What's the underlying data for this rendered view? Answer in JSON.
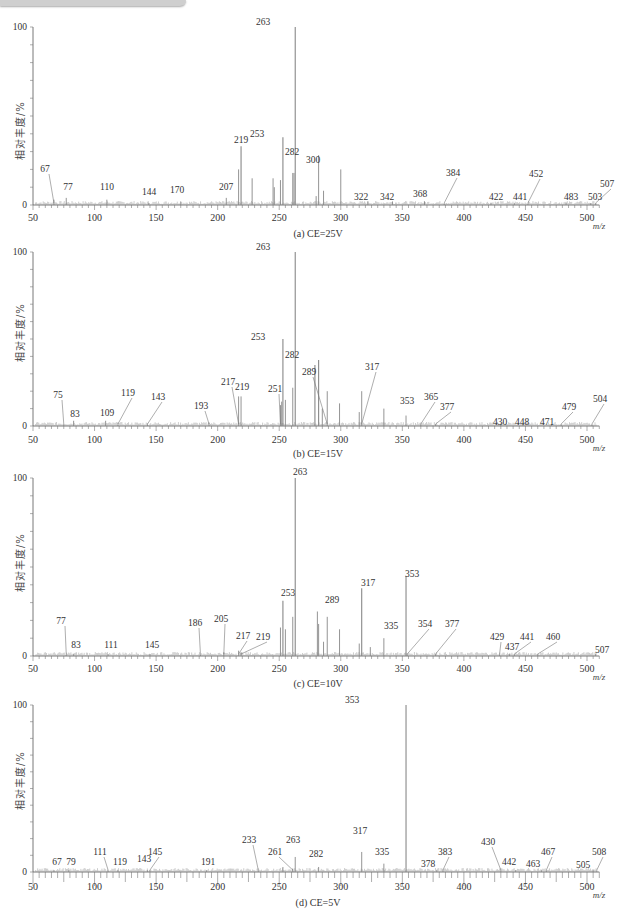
{
  "header": {
    "title_tab": ""
  },
  "chart_data": [
    {
      "type": "bar",
      "panel": "a",
      "title": "(a) CE=25V",
      "xlabel": "m/z",
      "ylabel": "相对丰度/%",
      "xlim": [
        50,
        510
      ],
      "ylim": [
        0,
        100
      ],
      "xticks": [
        50,
        100,
        150,
        200,
        250,
        300,
        350,
        400,
        450,
        500
      ],
      "yticks": [
        0,
        100
      ],
      "peaks": [
        {
          "mz": 67,
          "rel": 3,
          "label": "67"
        },
        {
          "mz": 77,
          "rel": 4,
          "label": "77"
        },
        {
          "mz": 110,
          "rel": 3,
          "label": "110"
        },
        {
          "mz": 144,
          "rel": 1,
          "label": "144"
        },
        {
          "mz": 170,
          "rel": 2,
          "label": "170"
        },
        {
          "mz": 207,
          "rel": 4,
          "label": "207"
        },
        {
          "mz": 217,
          "rel": 20,
          "label": ""
        },
        {
          "mz": 219,
          "rel": 33,
          "label": "219"
        },
        {
          "mz": 228,
          "rel": 15,
          "label": ""
        },
        {
          "mz": 245,
          "rel": 15,
          "label": ""
        },
        {
          "mz": 246,
          "rel": 10,
          "label": ""
        },
        {
          "mz": 251,
          "rel": 14,
          "label": ""
        },
        {
          "mz": 253,
          "rel": 38,
          "label": "253"
        },
        {
          "mz": 261,
          "rel": 18,
          "label": ""
        },
        {
          "mz": 262,
          "rel": 18,
          "label": ""
        },
        {
          "mz": 263,
          "rel": 100,
          "label": "263"
        },
        {
          "mz": 280,
          "rel": 5,
          "label": ""
        },
        {
          "mz": 282,
          "rel": 28,
          "label": "282"
        },
        {
          "mz": 286,
          "rel": 8,
          "label": ""
        },
        {
          "mz": 300,
          "rel": 20,
          "label": "300"
        },
        {
          "mz": 322,
          "rel": 2,
          "label": "322"
        },
        {
          "mz": 342,
          "rel": 2,
          "label": "342"
        },
        {
          "mz": 368,
          "rel": 2,
          "label": "368"
        },
        {
          "mz": 384,
          "rel": 1,
          "label": "384"
        },
        {
          "mz": 422,
          "rel": 1,
          "label": "422"
        },
        {
          "mz": 441,
          "rel": 1,
          "label": "441"
        },
        {
          "mz": 452,
          "rel": 1,
          "label": "452"
        },
        {
          "mz": 483,
          "rel": 1,
          "label": "483"
        },
        {
          "mz": 503,
          "rel": 1,
          "label": "503"
        },
        {
          "mz": 507,
          "rel": 1,
          "label": "507"
        }
      ]
    },
    {
      "type": "bar",
      "panel": "b",
      "title": "(b) CE=15V",
      "xlabel": "m/z",
      "ylabel": "相对丰度/%",
      "xlim": [
        50,
        510
      ],
      "ylim": [
        0,
        100
      ],
      "xticks": [
        50,
        100,
        150,
        200,
        250,
        300,
        350,
        400,
        450,
        500
      ],
      "yticks": [
        0,
        100
      ],
      "peaks": [
        {
          "mz": 75,
          "rel": 1,
          "label": "75"
        },
        {
          "mz": 83,
          "rel": 3,
          "label": "83"
        },
        {
          "mz": 109,
          "rel": 3,
          "label": "109"
        },
        {
          "mz": 119,
          "rel": 2,
          "label": "119"
        },
        {
          "mz": 143,
          "rel": 1,
          "label": "143"
        },
        {
          "mz": 193,
          "rel": 2,
          "label": "193"
        },
        {
          "mz": 217,
          "rel": 17,
          "label": "217"
        },
        {
          "mz": 219,
          "rel": 17,
          "label": "219"
        },
        {
          "mz": 251,
          "rel": 12,
          "label": "251"
        },
        {
          "mz": 252,
          "rel": 14,
          "label": ""
        },
        {
          "mz": 253,
          "rel": 50,
          "label": "253"
        },
        {
          "mz": 255,
          "rel": 15,
          "label": ""
        },
        {
          "mz": 261,
          "rel": 22,
          "label": ""
        },
        {
          "mz": 263,
          "rel": 100,
          "label": "263"
        },
        {
          "mz": 279,
          "rel": 35,
          "label": ""
        },
        {
          "mz": 282,
          "rel": 38,
          "label": "282"
        },
        {
          "mz": 285,
          "rel": 10,
          "label": ""
        },
        {
          "mz": 289,
          "rel": 20,
          "label": "289"
        },
        {
          "mz": 299,
          "rel": 13,
          "label": ""
        },
        {
          "mz": 315,
          "rel": 8,
          "label": ""
        },
        {
          "mz": 317,
          "rel": 20,
          "label": "317"
        },
        {
          "mz": 335,
          "rel": 10,
          "label": ""
        },
        {
          "mz": 353,
          "rel": 6,
          "label": "353"
        },
        {
          "mz": 365,
          "rel": 1,
          "label": "365"
        },
        {
          "mz": 377,
          "rel": 1,
          "label": "377"
        },
        {
          "mz": 430,
          "rel": 1,
          "label": "430"
        },
        {
          "mz": 448,
          "rel": 1,
          "label": "448"
        },
        {
          "mz": 471,
          "rel": 1,
          "label": "471"
        },
        {
          "mz": 479,
          "rel": 1,
          "label": "479"
        },
        {
          "mz": 504,
          "rel": 1,
          "label": "504"
        }
      ]
    },
    {
      "type": "bar",
      "panel": "c",
      "title": "(c) CE=10V",
      "xlabel": "m/z",
      "ylabel": "相对丰度/%",
      "xlim": [
        50,
        510
      ],
      "ylim": [
        0,
        100
      ],
      "xticks": [
        50,
        100,
        150,
        200,
        250,
        300,
        350,
        400,
        450,
        500
      ],
      "yticks": [
        0,
        100
      ],
      "peaks": [
        {
          "mz": 77,
          "rel": 1,
          "label": "77"
        },
        {
          "mz": 83,
          "rel": 1,
          "label": "83"
        },
        {
          "mz": 111,
          "rel": 1,
          "label": "111"
        },
        {
          "mz": 145,
          "rel": 1,
          "label": "145"
        },
        {
          "mz": 186,
          "rel": 1,
          "label": "186"
        },
        {
          "mz": 205,
          "rel": 2,
          "label": "205"
        },
        {
          "mz": 217,
          "rel": 3,
          "label": "217"
        },
        {
          "mz": 219,
          "rel": 2,
          "label": "219"
        },
        {
          "mz": 251,
          "rel": 16,
          "label": ""
        },
        {
          "mz": 253,
          "rel": 31,
          "label": "253"
        },
        {
          "mz": 255,
          "rel": 15,
          "label": ""
        },
        {
          "mz": 261,
          "rel": 22,
          "label": ""
        },
        {
          "mz": 263,
          "rel": 100,
          "label": "263"
        },
        {
          "mz": 281,
          "rel": 25,
          "label": ""
        },
        {
          "mz": 282,
          "rel": 18,
          "label": ""
        },
        {
          "mz": 286,
          "rel": 8,
          "label": ""
        },
        {
          "mz": 289,
          "rel": 22,
          "label": "289"
        },
        {
          "mz": 299,
          "rel": 15,
          "label": ""
        },
        {
          "mz": 315,
          "rel": 7,
          "label": ""
        },
        {
          "mz": 317,
          "rel": 38,
          "label": "317"
        },
        {
          "mz": 324,
          "rel": 5,
          "label": ""
        },
        {
          "mz": 335,
          "rel": 10,
          "label": "335"
        },
        {
          "mz": 353,
          "rel": 45,
          "label": "353"
        },
        {
          "mz": 354,
          "rel": 1,
          "label": "354"
        },
        {
          "mz": 377,
          "rel": 1,
          "label": "377"
        },
        {
          "mz": 429,
          "rel": 1,
          "label": "429"
        },
        {
          "mz": 437,
          "rel": 1,
          "label": "437"
        },
        {
          "mz": 441,
          "rel": 1,
          "label": "441"
        },
        {
          "mz": 460,
          "rel": 1,
          "label": "460"
        },
        {
          "mz": 507,
          "rel": 1,
          "label": "507"
        }
      ]
    },
    {
      "type": "bar",
      "panel": "d",
      "title": "(d) CE=5V",
      "xlabel": "m/z",
      "ylabel": "相对丰度/%",
      "xlim": [
        50,
        510
      ],
      "ylim": [
        0,
        100
      ],
      "xticks": [
        50,
        100,
        150,
        200,
        250,
        300,
        350,
        400,
        450,
        500
      ],
      "yticks": [
        0,
        100
      ],
      "peaks": [
        {
          "mz": 67,
          "rel": 1,
          "label": "67"
        },
        {
          "mz": 79,
          "rel": 1,
          "label": "79"
        },
        {
          "mz": 111,
          "rel": 1,
          "label": "111"
        },
        {
          "mz": 119,
          "rel": 1,
          "label": "119"
        },
        {
          "mz": 143,
          "rel": 1,
          "label": "143"
        },
        {
          "mz": 145,
          "rel": 1,
          "label": "145"
        },
        {
          "mz": 191,
          "rel": 1,
          "label": "191"
        },
        {
          "mz": 233,
          "rel": 1,
          "label": "233"
        },
        {
          "mz": 253,
          "rel": 3,
          "label": ""
        },
        {
          "mz": 261,
          "rel": 2,
          "label": "261"
        },
        {
          "mz": 263,
          "rel": 9,
          "label": "263"
        },
        {
          "mz": 282,
          "rel": 3,
          "label": "282"
        },
        {
          "mz": 317,
          "rel": 12,
          "label": "317"
        },
        {
          "mz": 335,
          "rel": 5,
          "label": "335"
        },
        {
          "mz": 353,
          "rel": 100,
          "label": "353"
        },
        {
          "mz": 378,
          "rel": 1,
          "label": "378"
        },
        {
          "mz": 383,
          "rel": 1,
          "label": "383"
        },
        {
          "mz": 430,
          "rel": 1,
          "label": "430"
        },
        {
          "mz": 442,
          "rel": 1,
          "label": "442"
        },
        {
          "mz": 463,
          "rel": 1,
          "label": "463"
        },
        {
          "mz": 467,
          "rel": 1,
          "label": "467"
        },
        {
          "mz": 505,
          "rel": 1,
          "label": "505"
        },
        {
          "mz": 508,
          "rel": 1,
          "label": "508"
        }
      ]
    }
  ],
  "layout": {
    "panels": [
      {
        "y100": 27,
        "y0": 205,
        "xlab_y": 221,
        "cap_y": 228,
        "labels": {
          "67": [
            45,
            172,
            "lead"
          ],
          "77": [
            68,
            190
          ],
          "110": [
            107,
            190
          ],
          "144": [
            149,
            195
          ],
          "170": [
            177,
            193
          ],
          "207": [
            226,
            190
          ],
          "219": [
            241,
            143
          ],
          "253": [
            257,
            137
          ],
          "263": [
            263,
            25
          ],
          "282": [
            292,
            155
          ],
          "300": [
            313,
            163
          ],
          "322": [
            361,
            200
          ],
          "342": [
            387,
            200
          ],
          "368": [
            420,
            197
          ],
          "384": [
            453,
            176,
            "lead"
          ],
          "422": [
            496,
            200
          ],
          "441": [
            520,
            200
          ],
          "452": [
            536,
            177,
            "lead"
          ],
          "483": [
            571,
            200
          ],
          "503": [
            595,
            200
          ],
          "507": [
            607,
            187,
            "lead"
          ]
        }
      },
      {
        "y100": 252,
        "y0": 426,
        "xlab_y": 443,
        "cap_y": 448,
        "labels": {
          "75": [
            58,
            398,
            "lead"
          ],
          "83": [
            75,
            417
          ],
          "109": [
            107,
            416
          ],
          "119": [
            128,
            396,
            "lead"
          ],
          "143": [
            158,
            400,
            "lead"
          ],
          "193": [
            201,
            409,
            "lead"
          ],
          "217": [
            228,
            385,
            "lead"
          ],
          "219": [
            242,
            390
          ],
          "251": [
            275,
            392,
            "lead"
          ],
          "253": [
            258,
            340
          ],
          "263": [
            263,
            250
          ],
          "282": [
            292,
            358
          ],
          "289": [
            309,
            375,
            "lead"
          ],
          "317": [
            372,
            370,
            "lead"
          ],
          "353": [
            407,
            404
          ],
          "365": [
            431,
            400,
            "lead"
          ],
          "377": [
            447,
            410,
            "lead"
          ],
          "430": [
            500,
            425
          ],
          "448": [
            522,
            425
          ],
          "471": [
            547,
            425
          ],
          "479": [
            569,
            410,
            "lead"
          ],
          "504": [
            600,
            402,
            "lead"
          ]
        }
      },
      {
        "y100": 478,
        "y0": 656,
        "xlab_y": 672,
        "cap_y": 678,
        "labels": {
          "77": [
            61,
            624,
            "lead"
          ],
          "83": [
            76,
            648
          ],
          "111": [
            111,
            648
          ],
          "145": [
            152,
            648
          ],
          "186": [
            195,
            626,
            "lead"
          ],
          "205": [
            221,
            622,
            "lead"
          ],
          "217": [
            243,
            639,
            "lead"
          ],
          "219": [
            263,
            640,
            "lead"
          ],
          "253": [
            288,
            596
          ],
          "263": [
            300,
            475
          ],
          "289": [
            332,
            603
          ],
          "317": [
            368,
            586
          ],
          "335": [
            391,
            629
          ],
          "353": [
            412,
            577
          ],
          "354": [
            425,
            627,
            "lead"
          ],
          "377": [
            452,
            627,
            "lead"
          ],
          "429": [
            497,
            640,
            "lead"
          ],
          "437": [
            512,
            650
          ],
          "441": [
            527,
            640,
            "lead"
          ],
          "460": [
            553,
            640,
            "lead"
          ],
          "507": [
            602,
            653
          ]
        }
      },
      {
        "y100": 705,
        "y0": 872,
        "xlab_y": 890,
        "cap_y": 897,
        "labels": {
          "67": [
            57,
            865
          ],
          "79": [
            71,
            865
          ],
          "111": [
            100,
            855,
            "lead"
          ],
          "119": [
            120,
            865
          ],
          "143": [
            144,
            862
          ],
          "145": [
            155,
            855,
            "lead"
          ],
          "191": [
            208,
            865
          ],
          "233": [
            249,
            843,
            "lead"
          ],
          "261": [
            275,
            855,
            "lead"
          ],
          "263": [
            293,
            843
          ],
          "282": [
            316,
            857
          ],
          "317": [
            360,
            834
          ],
          "335": [
            382,
            855
          ],
          "353": [
            352,
            703
          ],
          "378": [
            428,
            867
          ],
          "383": [
            445,
            855,
            "lead"
          ],
          "430": [
            488,
            845,
            "lead"
          ],
          "442": [
            509,
            865
          ],
          "463": [
            533,
            867
          ],
          "467": [
            548,
            855,
            "lead"
          ],
          "505": [
            583,
            868
          ],
          "508": [
            599,
            855,
            "lead"
          ]
        }
      }
    ]
  }
}
